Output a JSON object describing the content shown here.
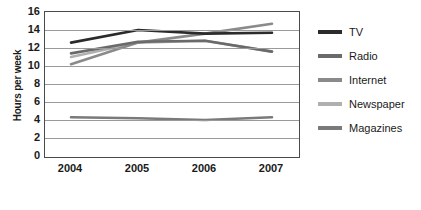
{
  "chart_data": {
    "type": "line",
    "title": "",
    "xlabel": "",
    "ylabel": "Hours per week",
    "categories": [
      "2004",
      "2005",
      "2006",
      "2007"
    ],
    "x": [
      2004,
      2005,
      2006,
      2007
    ],
    "ylim": [
      0,
      16
    ],
    "yticks": [
      16,
      14,
      12,
      10,
      8,
      6,
      4,
      2,
      0
    ],
    "grid": true,
    "legend_position": "right",
    "series": [
      {
        "name": "TV",
        "values": [
          12.6,
          14.0,
          13.6,
          13.7
        ],
        "color": "#2b2b2b"
      },
      {
        "name": "Radio",
        "values": [
          11.4,
          12.7,
          12.8,
          11.6
        ],
        "color": "#6a6a6a"
      },
      {
        "name": "Internet",
        "values": [
          10.2,
          12.6,
          13.6,
          14.7
        ],
        "color": "#8a8a8a"
      },
      {
        "name": "Newspaper",
        "values": [
          11.0,
          12.6,
          12.8,
          11.6
        ],
        "color": "#b0b0b0"
      },
      {
        "name": "Magazines",
        "values": [
          4.3,
          4.2,
          4.0,
          4.3
        ],
        "color": "#7a7a7a"
      }
    ]
  },
  "legend": {
    "items": [
      {
        "label": "TV"
      },
      {
        "label": "Radio"
      },
      {
        "label": "Internet"
      },
      {
        "label": "Newspaper"
      },
      {
        "label": "Magazines"
      }
    ]
  }
}
